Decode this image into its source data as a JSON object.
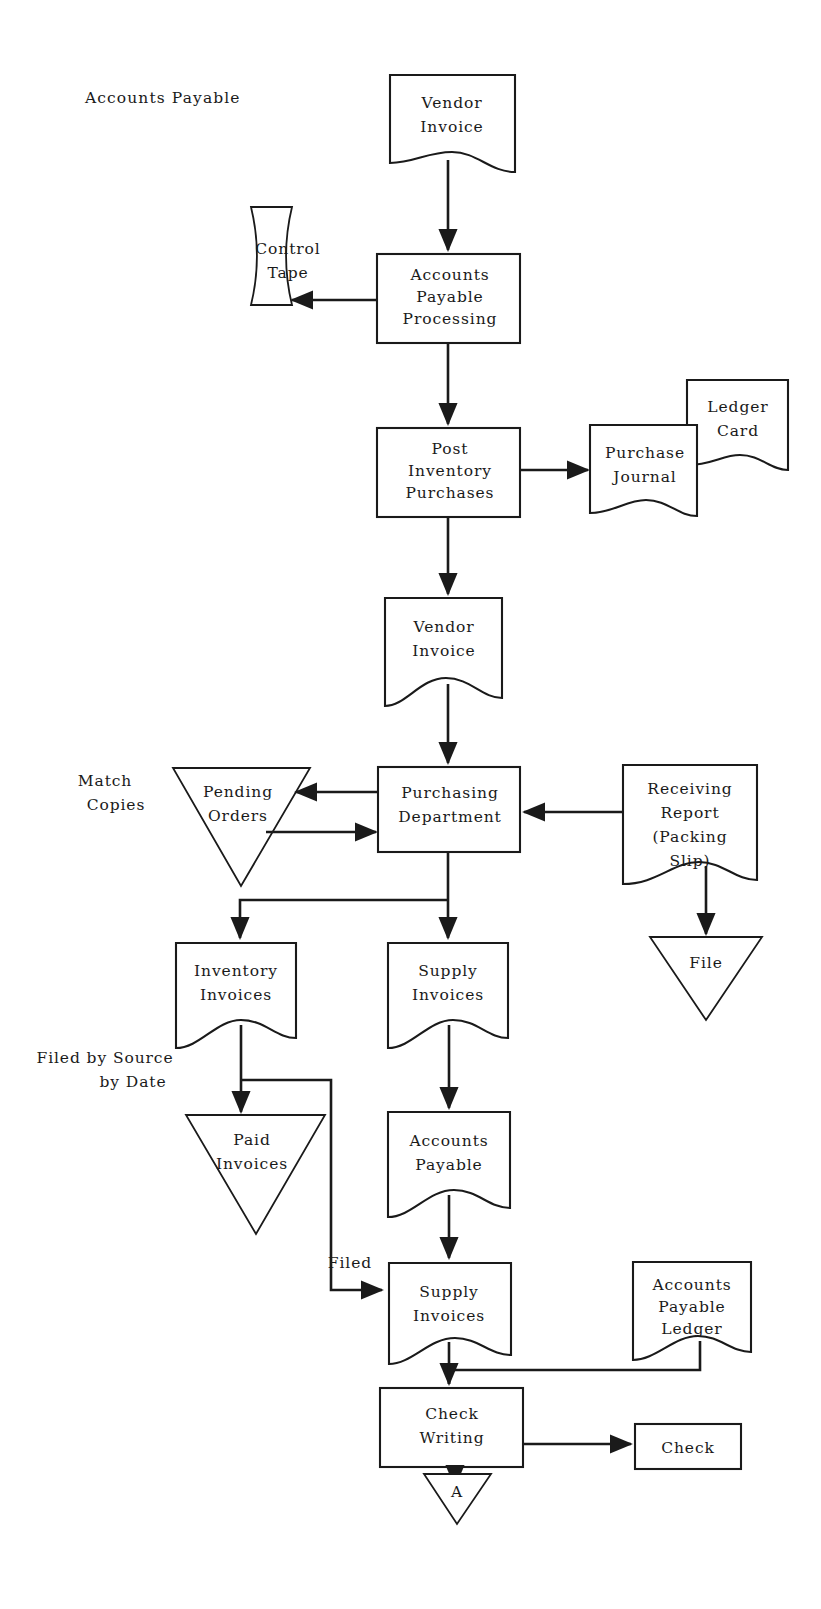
{
  "diagram": {
    "title": "Accounts Payable",
    "type": "flowchart",
    "domain": "accounting-document-flowchart",
    "ink_color": "#1a1a1a",
    "background_color": "#ffffff"
  },
  "nodes": {
    "title_label": {
      "text": "Accounts Payable",
      "shape": "text",
      "x": 150,
      "y": 98
    },
    "vendor_invoice_top": {
      "line1": "Vendor",
      "line2": "Invoice",
      "shape": "document",
      "x": 452,
      "y": 118
    },
    "control_tape": {
      "line1": "Control",
      "line2": "Tape",
      "shape": "tape",
      "x": 288,
      "y": 278
    },
    "ap_processing": {
      "line1": "Accounts",
      "line2": "Payable",
      "line3": "Processing",
      "shape": "process",
      "x": 448,
      "y": 298
    },
    "post_inventory": {
      "line1": "Post",
      "line2": "Inventory",
      "line3": "Purchases",
      "shape": "process",
      "x": 448,
      "y": 472
    },
    "purchase_journal": {
      "line1": "Purchase",
      "line2": "Journal",
      "shape": "document",
      "x": 643,
      "y": 470
    },
    "ledger_card": {
      "line1": "Ledger",
      "line2": "Card",
      "shape": "document",
      "x": 737,
      "y": 424
    },
    "vendor_invoice_mid": {
      "line1": "Vendor",
      "line2": "Invoice",
      "shape": "document",
      "x": 444,
      "y": 648
    },
    "match_copies_label": {
      "line1": "Match",
      "line2": "Copies",
      "shape": "text",
      "x": 105,
      "y": 790
    },
    "pending_orders": {
      "line1": "Pending",
      "line2": "Orders",
      "shape": "triangle-file",
      "x": 241,
      "y": 800
    },
    "purchasing_department": {
      "line1": "Purchasing",
      "line2": "Department",
      "shape": "process",
      "x": 449,
      "y": 809
    },
    "receiving_report": {
      "line1": "Receiving",
      "line2": "Report",
      "line3": "(Packing",
      "line4": "Slip)",
      "shape": "document",
      "x": 689,
      "y": 820
    },
    "file_triangle": {
      "line1": "File",
      "shape": "triangle-file",
      "x": 705,
      "y": 960
    },
    "inventory_invoices": {
      "line1": "Inventory",
      "line2": "Invoices",
      "shape": "document",
      "x": 236,
      "y": 990
    },
    "supply_invoices_mid": {
      "line1": "Supply",
      "line2": "Invoices",
      "shape": "document",
      "x": 448,
      "y": 990
    },
    "filed_by_source_label": {
      "line1": "Filed by Source",
      "line2": "by Date",
      "shape": "text",
      "x": 120,
      "y": 1067
    },
    "paid_invoices": {
      "line1": "Paid",
      "line2": "Invoices",
      "shape": "triangle-file",
      "x": 285,
      "y": 1080
    },
    "accounts_payable_doc": {
      "line1": "Accounts",
      "line2": "Payable",
      "shape": "document",
      "x": 449,
      "y": 1160
    },
    "filed_label": {
      "text": "Filed",
      "shape": "text",
      "x": 349,
      "y": 1262
    },
    "supply_invoices_bottom": {
      "line1": "Supply",
      "line2": "Invoices",
      "shape": "document",
      "x": 449,
      "y": 1310
    },
    "ap_ledger": {
      "line1": "Accounts",
      "line2": "Payable",
      "line3": "Ledger",
      "shape": "document",
      "x": 691,
      "y": 1305
    },
    "check_writing": {
      "line1": "Check",
      "line2": "Writing",
      "shape": "process",
      "x": 449,
      "y": 1412
    },
    "check_box": {
      "line1": "Check",
      "shape": "process",
      "x": 687,
      "y": 1447
    },
    "connector_a": {
      "text": "A",
      "shape": "triangle-file",
      "x": 456,
      "y": 1492
    }
  },
  "edges": [
    {
      "from": "vendor_invoice_top",
      "to": "ap_processing",
      "arrow": true,
      "direction": "down"
    },
    {
      "from": "ap_processing",
      "to": "control_tape",
      "arrow": true,
      "direction": "left"
    },
    {
      "from": "ap_processing",
      "to": "post_inventory",
      "arrow": true,
      "direction": "down"
    },
    {
      "from": "post_inventory",
      "to": "purchase_journal",
      "arrow": true,
      "direction": "right"
    },
    {
      "from": "post_inventory",
      "to": "vendor_invoice_mid",
      "arrow": true,
      "direction": "down"
    },
    {
      "from": "vendor_invoice_mid",
      "to": "purchasing_department",
      "arrow": true,
      "direction": "down"
    },
    {
      "from": "purchasing_department",
      "to": "pending_orders",
      "arrow": true,
      "direction": "left"
    },
    {
      "from": "pending_orders",
      "to": "purchasing_department",
      "arrow": true,
      "direction": "right"
    },
    {
      "from": "receiving_report",
      "to": "purchasing_department",
      "arrow": true,
      "direction": "left"
    },
    {
      "from": "receiving_report",
      "to": "file_triangle",
      "arrow": true,
      "direction": "down"
    },
    {
      "from": "purchasing_department",
      "to": "inventory_invoices",
      "arrow": true,
      "direction": "down-left"
    },
    {
      "from": "purchasing_department",
      "to": "supply_invoices_mid",
      "arrow": true,
      "direction": "down"
    },
    {
      "from": "inventory_invoices",
      "to": "paid_invoices",
      "arrow": true,
      "direction": "down"
    },
    {
      "from": "inventory_invoices",
      "to": "supply_invoices_bottom",
      "arrow": true,
      "direction": "down-right",
      "label": "Filed"
    },
    {
      "from": "supply_invoices_mid",
      "to": "accounts_payable_doc",
      "arrow": true,
      "direction": "down"
    },
    {
      "from": "accounts_payable_doc",
      "to": "supply_invoices_bottom",
      "arrow": true,
      "direction": "down"
    },
    {
      "from": "ap_ledger",
      "to": "check_writing",
      "arrow": true,
      "direction": "down-left"
    },
    {
      "from": "supply_invoices_bottom",
      "to": "check_writing",
      "arrow": true,
      "direction": "down"
    },
    {
      "from": "check_writing",
      "to": "check_box",
      "arrow": true,
      "direction": "right"
    },
    {
      "from": "check_writing",
      "to": "connector_a",
      "arrow": true,
      "direction": "down"
    }
  ]
}
